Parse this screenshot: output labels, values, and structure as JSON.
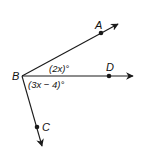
{
  "diagram": {
    "type": "angle-figure",
    "vertex": {
      "label": "B",
      "x": 22,
      "y": 76
    },
    "rays": [
      {
        "name": "ray-BA",
        "point_label": "A",
        "point": {
          "x": 101,
          "y": 33
        },
        "tip": {
          "x": 118,
          "y": 24
        }
      },
      {
        "name": "ray-BD",
        "point_label": "D",
        "point": {
          "x": 109,
          "y": 76
        },
        "tip": {
          "x": 133,
          "y": 76
        }
      },
      {
        "name": "ray-BC",
        "point_label": "C",
        "point": {
          "x": 37,
          "y": 127
        },
        "tip": {
          "x": 42,
          "y": 146
        }
      }
    ],
    "angles": [
      {
        "name": "angle-ABD",
        "label": "(2x)°"
      },
      {
        "name": "angle-DBC",
        "label": "(3x − 4)°"
      }
    ],
    "colors": {
      "stroke": "#1a1a1a",
      "background": "#ffffff"
    }
  }
}
